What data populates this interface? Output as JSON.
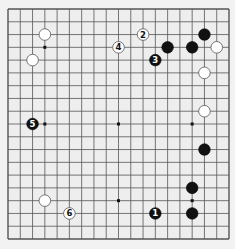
{
  "board": {
    "size": 19,
    "origin": {
      "x": 8,
      "y": 9
    },
    "end": {
      "x": 229,
      "y": 239
    },
    "background_color": "#eeeeee",
    "line_color": "#555555",
    "star_points": [
      [
        3,
        3
      ],
      [
        9,
        3
      ],
      [
        15,
        3
      ],
      [
        3,
        9
      ],
      [
        9,
        9
      ],
      [
        15,
        9
      ],
      [
        3,
        15
      ],
      [
        9,
        15
      ],
      [
        15,
        15
      ]
    ]
  },
  "stones": [
    {
      "color": "white",
      "col": 3,
      "row": 2,
      "label": ""
    },
    {
      "color": "white",
      "col": 2,
      "row": 4,
      "label": ""
    },
    {
      "color": "white",
      "col": 9,
      "row": 3,
      "label": "4"
    },
    {
      "color": "white",
      "col": 11,
      "row": 2,
      "label": "2"
    },
    {
      "color": "black",
      "col": 12,
      "row": 4,
      "label": "3"
    },
    {
      "color": "black",
      "col": 13,
      "row": 3,
      "label": ""
    },
    {
      "color": "black",
      "col": 15,
      "row": 3,
      "label": ""
    },
    {
      "color": "black",
      "col": 16,
      "row": 2,
      "label": ""
    },
    {
      "color": "white",
      "col": 17,
      "row": 3,
      "label": ""
    },
    {
      "color": "white",
      "col": 16,
      "row": 5,
      "label": ""
    },
    {
      "color": "white",
      "col": 16,
      "row": 8,
      "label": ""
    },
    {
      "color": "black",
      "col": 2,
      "row": 9,
      "label": "5"
    },
    {
      "color": "black",
      "col": 16,
      "row": 11,
      "label": ""
    },
    {
      "color": "black",
      "col": 15,
      "row": 14,
      "label": ""
    },
    {
      "color": "black",
      "col": 15,
      "row": 16,
      "label": ""
    },
    {
      "color": "black",
      "col": 12,
      "row": 16,
      "label": "1"
    },
    {
      "color": "white",
      "col": 3,
      "row": 15,
      "label": ""
    },
    {
      "color": "white",
      "col": 5,
      "row": 16,
      "label": "6"
    }
  ]
}
